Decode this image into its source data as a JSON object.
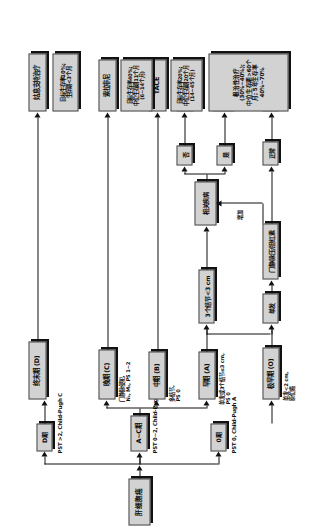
{
  "figure": {
    "type": "clinical-staging-flowchart",
    "orientation": "rotated-90-ccw",
    "root": "肝细胞癌"
  },
  "nodes": {
    "root": "肝细胞癌",
    "branch_0": "0期",
    "branch_ac": "A~C期",
    "branch_d": "D期",
    "stage_0": "极早期 (O)",
    "stage_a": "早期 (A)",
    "stage_b": "中期 (B)",
    "stage_c": "晚期 (C)",
    "stage_d": "终末期 (D)",
    "single": "单发",
    "three_nodules": "3个结节<3 cm",
    "portal_bili": "门静脉压/胆红素",
    "assoc_disease": "相关疾病",
    "normal": "正常",
    "yes": "是",
    "no": "否",
    "resection": "切除",
    "transplant": "肝移植\n(CLT/LDLT)",
    "rfa_pei": "射频/PEI",
    "tace": "TACE",
    "sorafenib": "索拉非尼",
    "palliative": "姑息支持治疗"
  },
  "criteria": {
    "pst_0": "PST 0, Child-Pugh A",
    "pst_ac": "PST 0~2, Child-Pugh A~B",
    "pst_d": "PST >2, Child-Pugh C",
    "stage_0_detail": "单发<2 cm,\n原位癌",
    "stage_a_detail": "单发或3个结节≤3 cm,\nPS 0",
    "stage_b_detail": "多结节,\nPS 0",
    "stage_c_detail": "门静脉侵犯,\nN₁, M₁, PS 1~2",
    "increased": "增加"
  },
  "outcomes": {
    "curative": "根治性治疗 (30%~40%);\n中位生存期>60个月; 5年生存率40%~70%",
    "tace_outcome": "目标生存率20%;\n中位生存期20个月\n(14~45个月)",
    "sorafenib_outcome": "目标生存率40%;\n中位生存期11个月\n(6~14个月)",
    "palliative_outcome": "目标生存率10%;\n生存期<3个月"
  },
  "colors": {
    "box_fill": "#d2d2d2",
    "box_border": "#4a4a4a",
    "shadow": "#111111",
    "line": "#111111",
    "text": "#0c0c0c"
  }
}
